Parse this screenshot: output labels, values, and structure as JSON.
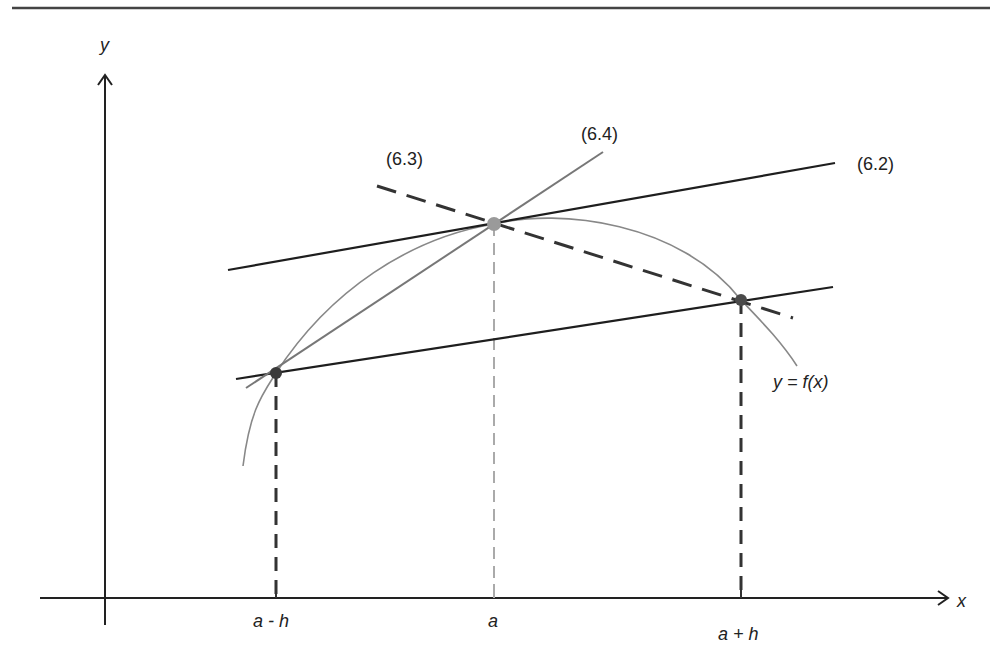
{
  "diagram": {
    "type": "numerical-differentiation-finite-difference",
    "axes": {
      "x_label": "x",
      "y_label": "y"
    },
    "x_ticks": [
      {
        "label": "a - h",
        "x": 276
      },
      {
        "label": "a",
        "x": 494
      },
      {
        "label": "a + h",
        "x": 741
      }
    ],
    "curve_label": "y = f(x)",
    "line_labels": {
      "central_difference": "(6.2)",
      "backward_difference": "(6.3)",
      "forward_difference": "(6.4)"
    },
    "points": [
      {
        "name": "left-point",
        "x": 276,
        "y": 373
      },
      {
        "name": "center-point",
        "x": 494,
        "y": 224
      },
      {
        "name": "right-point",
        "x": 741,
        "y": 300
      }
    ],
    "colors": {
      "axis": "#222222",
      "solid_line": "#1e1e1e",
      "gray_line": "#777777",
      "curve": "#888888",
      "dashed_dark": "#333333",
      "dashed_light": "#aaaaaa",
      "point_dark": "#3a3a3a",
      "point_light": "#9a9a9a"
    }
  }
}
